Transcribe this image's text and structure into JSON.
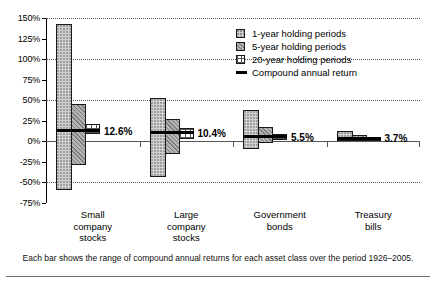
{
  "chart_data": {
    "type": "bar",
    "title": "",
    "subtitle": "",
    "xlabel": "",
    "ylabel": "",
    "ylim": [
      -75,
      150
    ],
    "yticks": [
      150,
      125,
      100,
      75,
      50,
      25,
      0,
      -25,
      -50,
      -75
    ],
    "ytick_labels": [
      "150%",
      "125%",
      "100%",
      "75%",
      "50%",
      "25%",
      "0%",
      "-25%",
      "-50%",
      "-75%"
    ],
    "gridlines": [
      150,
      100,
      50,
      -50
    ],
    "grid": "horizontal-dotted",
    "zero_line": 0,
    "legend_position": "top-right",
    "categories": [
      "Small\ncompany\nstocks",
      "Large\ncompany\nstocks",
      "Government\nbonds",
      "Treasury\nbills"
    ],
    "series": [
      {
        "name": "1-year holding periods",
        "key": "p1",
        "ranges": [
          {
            "low": -59,
            "high": 143
          },
          {
            "low": -43,
            "high": 53
          },
          {
            "low": -9,
            "high": 38
          },
          {
            "low": 0,
            "high": 12
          }
        ]
      },
      {
        "name": "5-year holding periods",
        "key": "p5",
        "ranges": [
          {
            "low": -29,
            "high": 45
          },
          {
            "low": -15,
            "high": 27
          },
          {
            "low": -2,
            "high": 18
          },
          {
            "low": 0,
            "high": 8
          }
        ]
      },
      {
        "name": "20-year holding periods",
        "key": "p20",
        "ranges": [
          {
            "low": 9,
            "high": 21
          },
          {
            "low": 3,
            "high": 16
          },
          {
            "low": 1,
            "high": 9
          },
          {
            "low": 0.5,
            "high": 5
          }
        ]
      }
    ],
    "compound_annual_return": {
      "name": "Compound annual return",
      "values": [
        12.6,
        10.4,
        5.5,
        3.7
      ],
      "labels": [
        "12.6%",
        "10.4%",
        "5.5%",
        "3.7%"
      ]
    }
  },
  "legend": {
    "items": [
      {
        "label": "1-year holding periods",
        "swatch": "p1"
      },
      {
        "label": "5-year holding periods",
        "swatch": "p5"
      },
      {
        "label": "20-year holding periods",
        "swatch": "p20"
      },
      {
        "label": "Compound annual return",
        "swatch": "line"
      }
    ]
  },
  "footnote": {
    "text": "Each bar shows the range of compound annual returns for each asset class over the period 1926–2005."
  },
  "colors": {
    "axis": "#000000",
    "grid": "#555555",
    "bar_border": "#1a1a1a",
    "series_1year": "#d2d2d2",
    "series_5year": "#b4b4b4",
    "series_20year": "#ffffff",
    "return_line": "#000000"
  }
}
